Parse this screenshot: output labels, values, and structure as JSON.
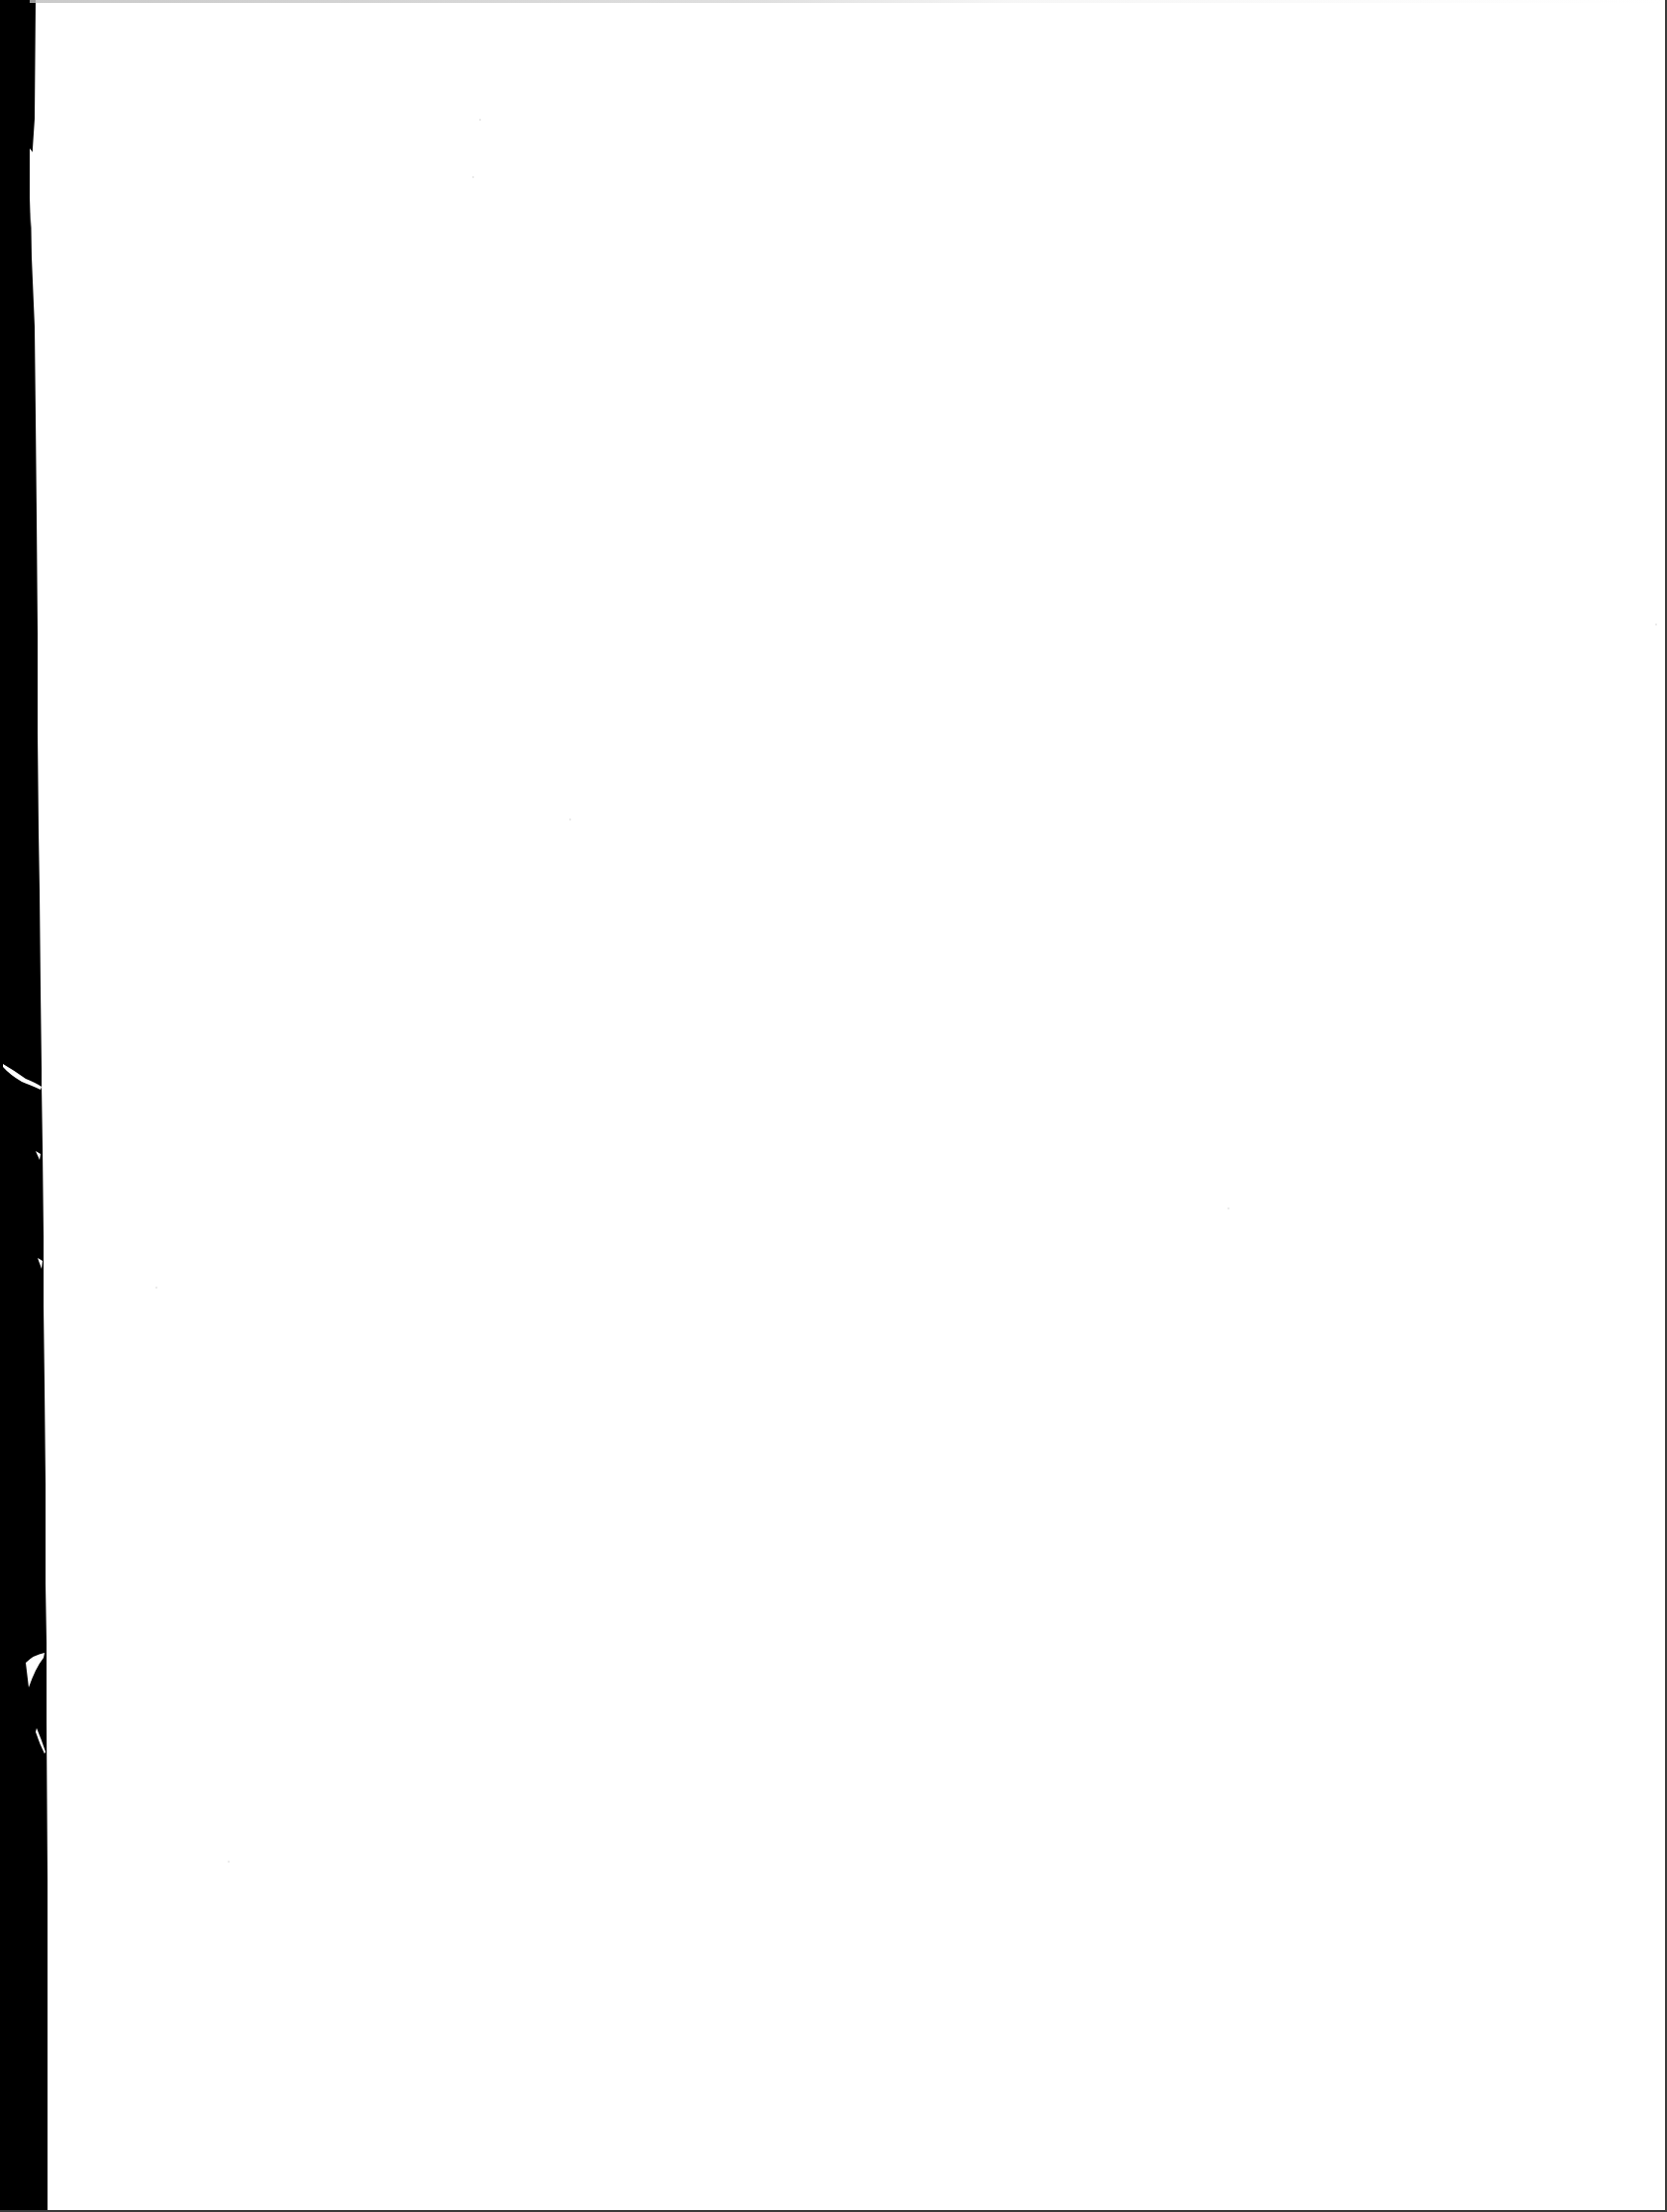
{
  "document": {
    "type": "scanned-page",
    "content": "blank",
    "text": ""
  },
  "colors": {
    "page_background": "#ffffff",
    "scanner_edge": "#000000",
    "border": "#3a3a3a"
  }
}
